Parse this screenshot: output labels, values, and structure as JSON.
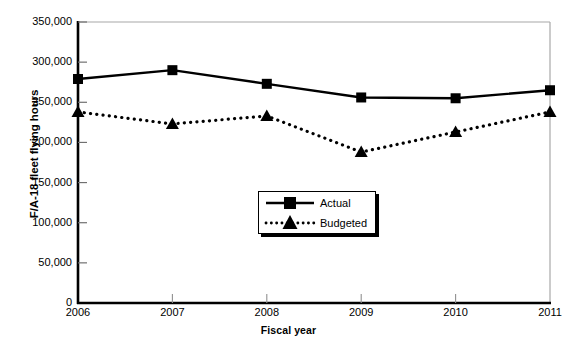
{
  "chart_data": {
    "type": "line",
    "title": "",
    "xlabel": "Fiscal year",
    "ylabel": "F/A-18 fleet flying hours",
    "categories": [
      "2006",
      "2007",
      "2008",
      "2009",
      "2010",
      "2011"
    ],
    "x": [
      2006,
      2007,
      2008,
      2009,
      2010,
      2011
    ],
    "xlim": [
      2006,
      2011
    ],
    "ylim": [
      0,
      350000
    ],
    "ytick_labels": [
      "0",
      "50,000",
      "100,000",
      "150,000",
      "200,000",
      "250,000",
      "300,000",
      "350,000"
    ],
    "ytick_values": [
      0,
      50000,
      100000,
      150000,
      200000,
      250000,
      300000,
      350000
    ],
    "grid": false,
    "legend_position": "inside-center-lower",
    "series": [
      {
        "name": "Actual",
        "marker": "square",
        "line_style": "solid",
        "color": "#000000",
        "values": [
          279000,
          290000,
          273000,
          256000,
          255000,
          265000
        ]
      },
      {
        "name": "Budgeted",
        "marker": "triangle",
        "line_style": "dotted",
        "color": "#000000",
        "values": [
          238000,
          223000,
          233000,
          188000,
          213000,
          238000
        ]
      }
    ]
  },
  "legend": {
    "items": [
      {
        "label": "Actual"
      },
      {
        "label": "Budgeted"
      }
    ]
  }
}
